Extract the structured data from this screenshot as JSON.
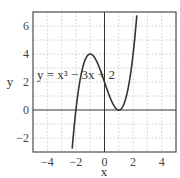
{
  "chart_data": {
    "type": "line",
    "title": "",
    "annotation": "y = x³ − 3x + 2",
    "xlabel": "x",
    "ylabel": "y",
    "xlim": [
      -5,
      5
    ],
    "ylim": [
      -3,
      7
    ],
    "xticks": [
      -4,
      -2,
      0,
      2,
      4
    ],
    "yticks": [
      -2,
      0,
      2,
      4,
      6
    ],
    "xtick_labels": [
      "−4",
      "−2",
      "0",
      "2",
      "4"
    ],
    "ytick_labels": [
      "−2",
      "0",
      "2",
      "4",
      "6"
    ],
    "grid": true,
    "series": [
      {
        "name": "y = x^3 - 3x + 2",
        "function": "x^3 - 3x + 2",
        "x": [
          -2.2,
          -2,
          -1.5,
          -1,
          -0.5,
          0,
          0.5,
          1,
          1.5,
          2,
          2.2
        ],
        "values": [
          -2.05,
          0,
          3.125,
          4,
          3.375,
          2,
          0.625,
          0,
          0.875,
          4,
          6.05
        ]
      }
    ]
  }
}
